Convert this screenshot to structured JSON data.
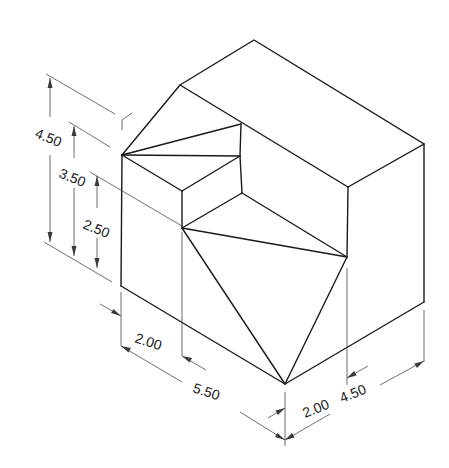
{
  "diagram": {
    "dimensions": {
      "height_total": "4.50",
      "height_mid": "3.50",
      "height_low": "2.50",
      "front_step_width": "2.00",
      "front_length": "5.50",
      "side_step_depth": "2.00",
      "side_depth": "4.50"
    }
  }
}
